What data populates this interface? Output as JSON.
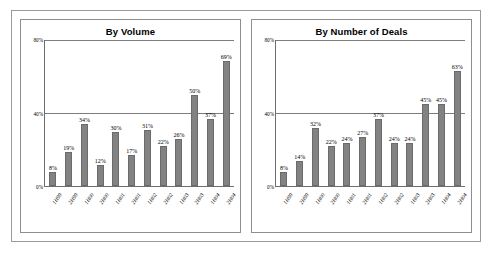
{
  "figure": {
    "panel_count": 2,
    "bar_color": "#828282",
    "axis_color": "#6e6e6e",
    "frame_color": "#9a9a9a"
  },
  "charts": [
    {
      "id": "by-volume",
      "title": "By Volume"
    },
    {
      "id": "by-number-of-deals",
      "title": "By Number of Deals"
    }
  ],
  "chart_data": [
    {
      "type": "bar",
      "title": "By Volume",
      "xlabel": "",
      "ylabel": "",
      "ylim": [
        0,
        80
      ],
      "yticks": [
        0,
        40,
        80
      ],
      "ytick_labels": [
        "0%",
        "40%",
        "80%"
      ],
      "grid": true,
      "legend": "none",
      "categories": [
        "1H99",
        "2H99",
        "1H00",
        "2H00",
        "1H01",
        "2H01",
        "1H02",
        "2H02",
        "1H03",
        "2H03",
        "1H04",
        "2H04"
      ],
      "values": [
        8,
        19,
        34,
        12,
        30,
        17,
        31,
        22,
        26,
        50,
        37,
        69
      ],
      "data_labels": [
        "8%",
        "19%",
        "34%",
        "12%",
        "30%",
        "17%",
        "31%",
        "22%",
        "26%",
        "50%",
        "37%",
        "69%"
      ]
    },
    {
      "type": "bar",
      "title": "By Number of Deals",
      "xlabel": "",
      "ylabel": "",
      "ylim": [
        0,
        80
      ],
      "yticks": [
        0,
        40,
        80
      ],
      "ytick_labels": [
        "0%",
        "40%",
        "80%"
      ],
      "grid": true,
      "legend": "none",
      "categories": [
        "1H99",
        "2H99",
        "1H00",
        "2H00",
        "1H01",
        "2H01",
        "1H02",
        "2H02",
        "1H03",
        "2H03",
        "1H04",
        "2H04"
      ],
      "values": [
        8,
        14,
        32,
        22,
        24,
        27,
        37,
        24,
        24,
        45,
        45,
        63
      ],
      "data_labels": [
        "8%",
        "14%",
        "32%",
        "22%",
        "24%",
        "27%",
        "37%",
        "24%",
        "24%",
        "45%",
        "45%",
        "63%"
      ]
    }
  ]
}
